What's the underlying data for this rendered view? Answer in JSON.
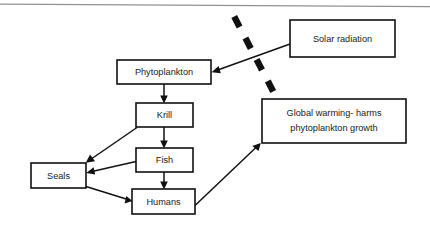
{
  "diagram": {
    "background_color": "#ffffff",
    "line_color": "#111111",
    "rule_color": "#8e9195",
    "nodes": [
      {
        "id": "phytoplankton",
        "label": "Phytoplankton",
        "x": 117,
        "y": 60,
        "w": 94,
        "h": 24
      },
      {
        "id": "krill",
        "label": "Krill",
        "x": 136,
        "y": 103,
        "w": 57,
        "h": 24
      },
      {
        "id": "fish",
        "label": "Fish",
        "x": 136,
        "y": 148,
        "w": 57,
        "h": 24
      },
      {
        "id": "seals",
        "label": "Seals",
        "x": 31,
        "y": 163,
        "w": 55,
        "h": 25
      },
      {
        "id": "humans",
        "label": "Humans",
        "x": 132,
        "y": 189,
        "w": 63,
        "h": 25
      },
      {
        "id": "solar-radiation",
        "label": "Solar radiation",
        "x": 290,
        "y": 20,
        "w": 105,
        "h": 37
      },
      {
        "id": "global-warming",
        "label_line1": "Global warming- harms",
        "label_line2": "phytoplankton growth",
        "x": 262,
        "y": 99,
        "w": 144,
        "h": 44
      }
    ],
    "edges": [
      {
        "id": "phytoplankton-to-krill",
        "from": "phytoplankton",
        "to": "krill"
      },
      {
        "id": "krill-to-fish",
        "from": "krill",
        "to": "fish"
      },
      {
        "id": "fish-to-humans",
        "from": "fish",
        "to": "humans"
      },
      {
        "id": "krill-to-seals",
        "from": "krill",
        "to": "seals"
      },
      {
        "id": "fish-to-seals",
        "from": "fish",
        "to": "seals"
      },
      {
        "id": "seals-to-humans",
        "from": "seals",
        "to": "humans"
      },
      {
        "id": "solar-radiation-to-phytoplankton",
        "from": "solar-radiation",
        "to": "phytoplankton"
      },
      {
        "id": "humans-to-global-warming",
        "from": "humans",
        "to": "global-warming"
      }
    ],
    "barrier": {
      "id": "dashed-barrier",
      "dash_count": 4,
      "from_x": 233,
      "from_y": 16,
      "to_x": 275,
      "to_y": 97
    }
  }
}
